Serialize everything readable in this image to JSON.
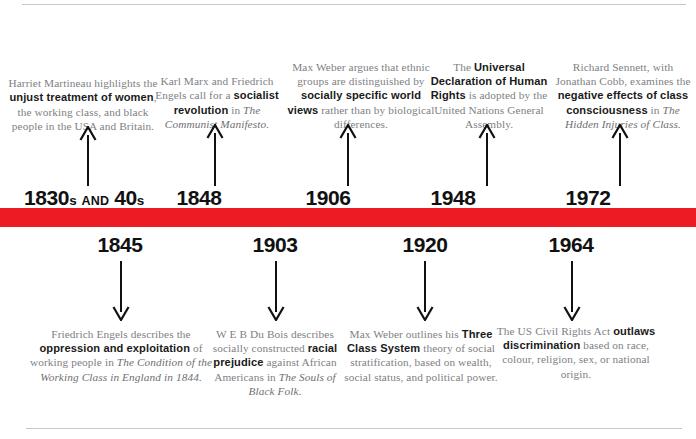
{
  "meta": {
    "accent_color": "#ec1c24",
    "body_text_color": "#7e7f83",
    "emphasis_color": "#1a1a1a",
    "hairline_color": "#c9c9cb"
  },
  "timeline": {
    "above": [
      {
        "year_label": "1830s AND 40s",
        "year_parts": [
          {
            "text": "1830",
            "style": "big"
          },
          {
            "text": "s",
            "style": "small"
          },
          {
            "text": " AND ",
            "style": "word"
          },
          {
            "text": "40",
            "style": "big"
          },
          {
            "text": "s",
            "style": "small"
          }
        ],
        "arrow": "arrow-up",
        "text_runs": [
          {
            "text": "Harriet Martineau highlights the ",
            "style": "normal"
          },
          {
            "text": "unjust treatment of women",
            "style": "bold"
          },
          {
            "text": ", the working class, and black people in the USA and Britain.",
            "style": "normal"
          }
        ]
      },
      {
        "year_label": "1848",
        "year_parts": [
          {
            "text": "1848",
            "style": "big"
          }
        ],
        "arrow": "arrow-up",
        "text_runs": [
          {
            "text": "Karl Marx and Friedrich Engels call for a ",
            "style": "normal"
          },
          {
            "text": "socialist revolution",
            "style": "bold"
          },
          {
            "text": " in ",
            "style": "normal"
          },
          {
            "text": "The Communist Manifesto.",
            "style": "italic"
          }
        ]
      },
      {
        "year_label": "1906",
        "year_parts": [
          {
            "text": "1906",
            "style": "big"
          }
        ],
        "arrow": "arrow-up",
        "text_runs": [
          {
            "text": "Max Weber argues that ethnic groups are distinguished by ",
            "style": "normal"
          },
          {
            "text": "socially specific world views",
            "style": "bold"
          },
          {
            "text": " rather than by biological differences.",
            "style": "normal"
          }
        ]
      },
      {
        "year_label": "1948",
        "year_parts": [
          {
            "text": "1948",
            "style": "big"
          }
        ],
        "arrow": "arrow-up",
        "text_runs": [
          {
            "text": "The ",
            "style": "normal"
          },
          {
            "text": "Universal Declaration of Human Rights",
            "style": "bold"
          },
          {
            "text": " is adopted by the United Nations General Assembly.",
            "style": "normal"
          }
        ]
      },
      {
        "year_label": "1972",
        "year_parts": [
          {
            "text": "1972",
            "style": "big"
          }
        ],
        "arrow": "arrow-up",
        "text_runs": [
          {
            "text": "Richard Sennett, with Jonathan Cobb, examines the ",
            "style": "normal"
          },
          {
            "text": "negative effects of class consciousness",
            "style": "bold"
          },
          {
            "text": " in ",
            "style": "normal"
          },
          {
            "text": "The Hidden Injuries of Class.",
            "style": "italic"
          }
        ]
      }
    ],
    "below": [
      {
        "year_label": "1845",
        "year_parts": [
          {
            "text": "1845",
            "style": "big"
          }
        ],
        "arrow": "arrow-down",
        "text_runs": [
          {
            "text": "Friedrich Engels describes the ",
            "style": "normal"
          },
          {
            "text": "oppression and exploitation",
            "style": "bold"
          },
          {
            "text": " of working people in ",
            "style": "normal"
          },
          {
            "text": "The Condition of the Working Class in England in 1844.",
            "style": "italic"
          }
        ]
      },
      {
        "year_label": "1903",
        "year_parts": [
          {
            "text": "1903",
            "style": "big"
          }
        ],
        "arrow": "arrow-down",
        "text_runs": [
          {
            "text": "W E B Du Bois describes socially constructed ",
            "style": "normal"
          },
          {
            "text": "racial prejudice",
            "style": "bold"
          },
          {
            "text": " against African Americans in ",
            "style": "normal"
          },
          {
            "text": "The Souls of Black Folk.",
            "style": "italic"
          }
        ]
      },
      {
        "year_label": "1920",
        "year_parts": [
          {
            "text": "1920",
            "style": "big"
          }
        ],
        "arrow": "arrow-down",
        "text_runs": [
          {
            "text": "Max Weber outlines his ",
            "style": "normal"
          },
          {
            "text": "Three Class System",
            "style": "bold"
          },
          {
            "text": " theory of social stratification, based on wealth, social status, and political power.",
            "style": "normal"
          }
        ]
      },
      {
        "year_label": "1964",
        "year_parts": [
          {
            "text": "1964",
            "style": "big"
          }
        ],
        "arrow": "arrow-down",
        "text_runs": [
          {
            "text": "The US Civil Rights Act ",
            "style": "normal"
          },
          {
            "text": "outlaws discrimination",
            "style": "bold"
          },
          {
            "text": " based on race, colour, religion, sex, or national origin.",
            "style": "normal"
          }
        ]
      }
    ]
  },
  "layout": {
    "above_geometry": [
      {
        "left": 8,
        "width": 150,
        "blurb_bottom": 133,
        "arrow_x": 88,
        "arrow_top": 126,
        "arrow_len": 60,
        "year_x": 24,
        "year_y": 187
      },
      {
        "left": 152,
        "width": 130,
        "blurb_bottom": 131,
        "arrow_x": 215,
        "arrow_top": 124,
        "arrow_len": 62,
        "year_x": 199,
        "year_y": 187
      },
      {
        "left": 286,
        "width": 150,
        "blurb_bottom": 131,
        "arrow_x": 348,
        "arrow_top": 124,
        "arrow_len": 62,
        "year_x": 328,
        "year_y": 187
      },
      {
        "left": 424,
        "width": 130,
        "blurb_bottom": 131,
        "arrow_x": 487,
        "arrow_top": 124,
        "arrow_len": 62,
        "year_x": 453,
        "year_y": 187
      },
      {
        "left": 552,
        "width": 142,
        "blurb_bottom": 131,
        "arrow_x": 620,
        "arrow_top": 124,
        "arrow_len": 62,
        "year_x": 588,
        "year_y": 187
      }
    ],
    "below_geometry": [
      {
        "left": 26,
        "width": 190,
        "blurb_top": 327,
        "arrow_x": 121,
        "arrow_top": 261,
        "arrow_len": 60,
        "year_x": 120,
        "year_y": 234
      },
      {
        "left": 200,
        "width": 150,
        "blurb_top": 327,
        "arrow_x": 276,
        "arrow_top": 261,
        "arrow_len": 60,
        "year_x": 275,
        "year_y": 234
      },
      {
        "left": 336,
        "width": 170,
        "blurb_top": 327,
        "arrow_x": 425,
        "arrow_top": 261,
        "arrow_len": 60,
        "year_x": 425,
        "year_y": 234
      },
      {
        "left": 494,
        "width": 164,
        "blurb_top": 324,
        "arrow_x": 572,
        "arrow_top": 261,
        "arrow_len": 60,
        "year_x": 571,
        "year_y": 234
      }
    ]
  }
}
